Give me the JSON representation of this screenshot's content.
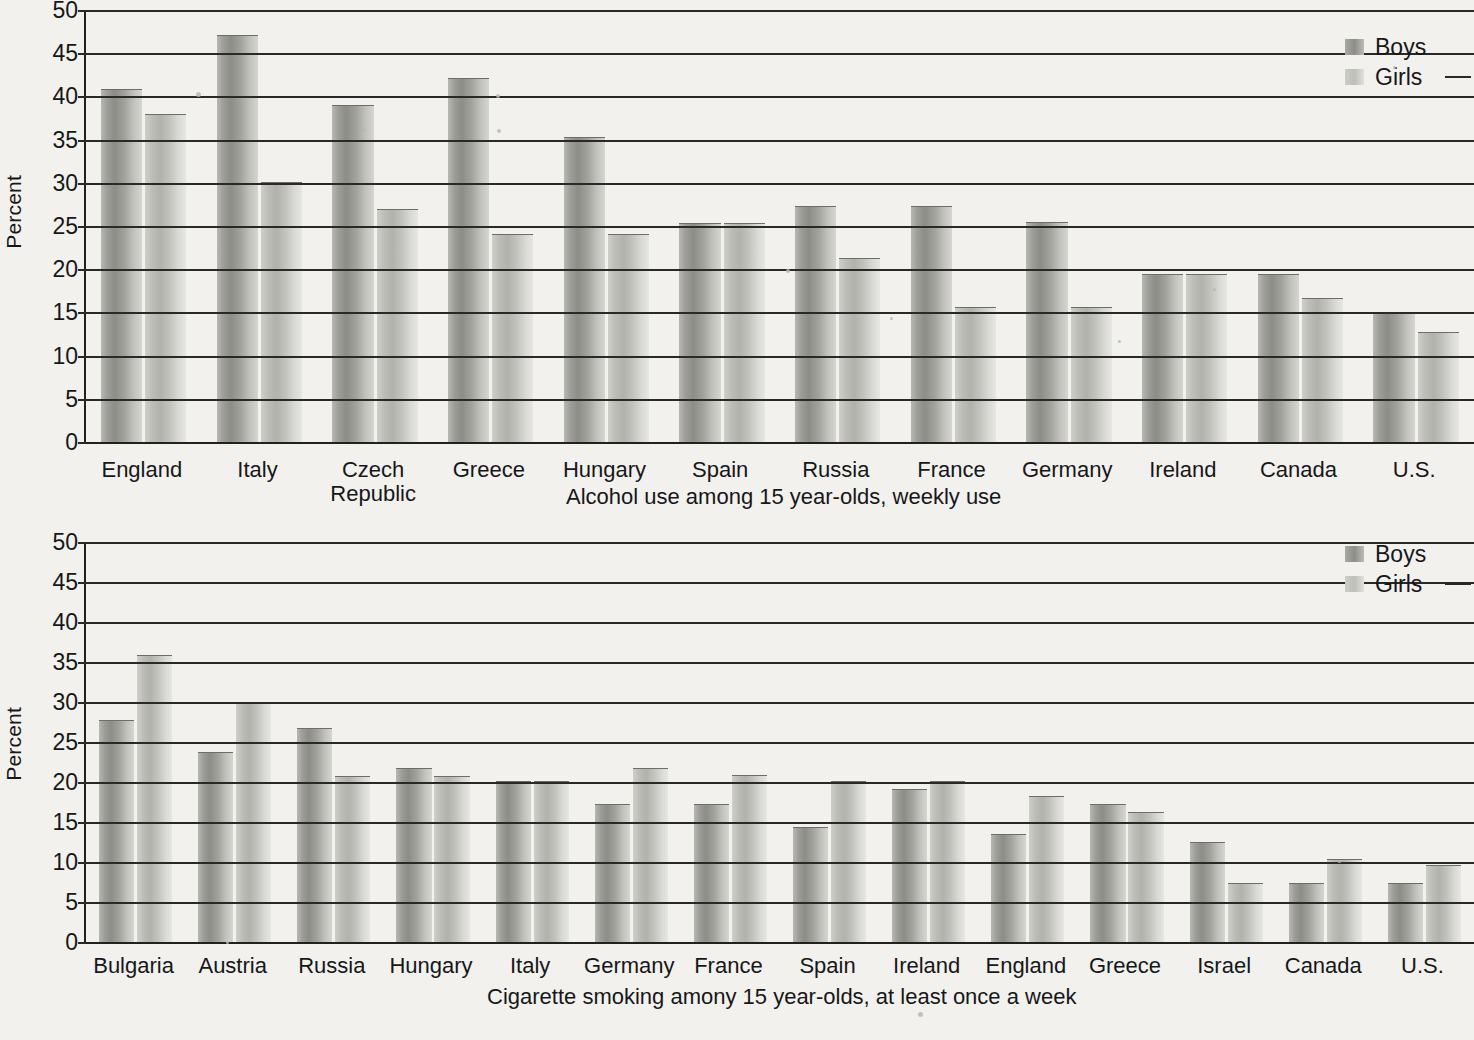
{
  "charts": [
    {
      "caption": "Alcohol use among 15 year-olds, weekly use",
      "ylabel": "Percent",
      "legend": {
        "boys": "Boys",
        "girls": "Girls"
      },
      "ticks": [
        "0",
        "5",
        "10",
        "15",
        "20",
        "25",
        "30",
        "35",
        "40",
        "45",
        "50"
      ]
    },
    {
      "caption": "Cigarette smoking amony 15 year-olds, at least once a week",
      "ylabel": "Percent",
      "legend": {
        "boys": "Boys",
        "girls": "Girls"
      },
      "ticks": [
        "0",
        "5",
        "10",
        "15",
        "20",
        "25",
        "30",
        "35",
        "40",
        "45",
        "50"
      ]
    }
  ],
  "chart_data": [
    {
      "type": "bar",
      "title": "Alcohol use among 15 year-olds, weekly use",
      "xlabel": "",
      "ylabel": "Percent",
      "ylim": [
        0,
        50
      ],
      "yticks": [
        0,
        5,
        10,
        15,
        20,
        25,
        30,
        35,
        40,
        45,
        50
      ],
      "grid": true,
      "legend_position": "top-right",
      "categories": [
        "England",
        "Italy",
        "Czech Republic",
        "Greece",
        "Hungary",
        "Spain",
        "Russia",
        "France",
        "Germany",
        "Ireland",
        "Canada",
        "U.S."
      ],
      "series": [
        {
          "name": "Boys",
          "values": [
            40.9,
            47.1,
            39.0,
            42.1,
            35.3,
            25.3,
            27.3,
            27.3,
            25.5,
            19.5,
            19.5,
            14.9
          ]
        },
        {
          "name": "Girls",
          "values": [
            38.0,
            30.1,
            27.0,
            24.1,
            24.1,
            25.3,
            21.3,
            15.6,
            15.6,
            19.5,
            16.7,
            12.7
          ]
        }
      ]
    },
    {
      "type": "bar",
      "title": "Cigarette smoking amony 15 year-olds, at least once a week",
      "xlabel": "",
      "ylabel": "Percent",
      "ylim": [
        0,
        50
      ],
      "yticks": [
        0,
        5,
        10,
        15,
        20,
        25,
        30,
        35,
        40,
        45,
        50
      ],
      "grid": true,
      "legend_position": "top-right",
      "categories": [
        "Bulgaria",
        "Austria",
        "Russia",
        "Hungary",
        "Italy",
        "Germany",
        "France",
        "Spain",
        "Ireland",
        "England",
        "Greece",
        "Israel",
        "Canada",
        "U.S."
      ],
      "series": [
        {
          "name": "Boys",
          "values": [
            27.7,
            23.7,
            26.7,
            21.8,
            20.1,
            17.2,
            17.2,
            14.4,
            19.1,
            13.5,
            17.3,
            12.5,
            7.4,
            7.4
          ]
        },
        {
          "name": "Girls",
          "values": [
            35.9,
            29.9,
            20.7,
            20.7,
            20.1,
            21.8,
            20.9,
            20.1,
            20.1,
            18.2,
            16.3,
            7.4,
            10.4,
            9.6
          ]
        }
      ]
    }
  ],
  "colors": {
    "boys": "#9d9d98",
    "girls": "#c8c8c3",
    "axis": "#2a2927",
    "background": "#f2f1ed"
  }
}
